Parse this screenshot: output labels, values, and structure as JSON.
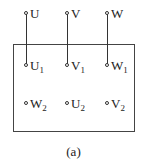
{
  "diagram": {
    "type": "motor-terminal-box",
    "supply_terminals": [
      {
        "name": "U",
        "sub": ""
      },
      {
        "name": "V",
        "sub": ""
      },
      {
        "name": "W",
        "sub": ""
      }
    ],
    "box_row1": [
      {
        "name": "U",
        "sub": "1"
      },
      {
        "name": "V",
        "sub": "1"
      },
      {
        "name": "W",
        "sub": "1"
      }
    ],
    "box_row2": [
      {
        "name": "W",
        "sub": "2"
      },
      {
        "name": "U",
        "sub": "2"
      },
      {
        "name": "V",
        "sub": "2"
      }
    ],
    "caption": "(a)",
    "line_color": "#333333"
  }
}
